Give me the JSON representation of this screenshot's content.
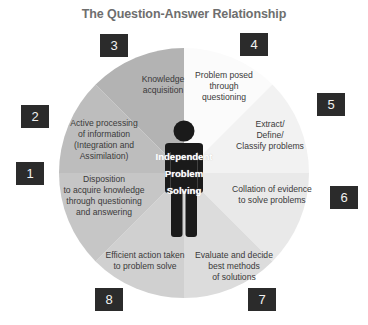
{
  "title": "The Question-Answer Relationship",
  "center": {
    "label": "Independent\nProblem\nSolving",
    "icon": "person-icon"
  },
  "colors": {
    "number_box_bg": "#2b2b2b",
    "number_box_text": "#f2f2f2",
    "title_text": "#6e6e6e",
    "label_text": "#3a3a3a",
    "figure": "#1a1a1a"
  },
  "segments": [
    {
      "number": "1",
      "label": "Disposition\nto acquire knowledge\nthrough questioning\nand answering",
      "fill": "#c4c4c4"
    },
    {
      "number": "2",
      "label": "Active processing\nof information\n(Integration and\nAssimilation)",
      "fill": "#bababa"
    },
    {
      "number": "3",
      "label": "Knowledge\nacquisition",
      "fill": "#b2b2b2"
    },
    {
      "number": "4",
      "label": "Problem posed\nthrough\nquestioning",
      "fill": "#fbfbfb"
    },
    {
      "number": "5",
      "label": "Extract/\nDefine/\nClassify problems",
      "fill": "#f2f2f2"
    },
    {
      "number": "6",
      "label": "Collation of evidence\nto solve problems",
      "fill": "#e9e9e9"
    },
    {
      "number": "7",
      "label": "Evaluate and decide\nbest methods\nof solutions",
      "fill": "#dcdcdc"
    },
    {
      "number": "8",
      "label": "Efficient action taken\nto problem solve",
      "fill": "#d0d0d0"
    }
  ]
}
